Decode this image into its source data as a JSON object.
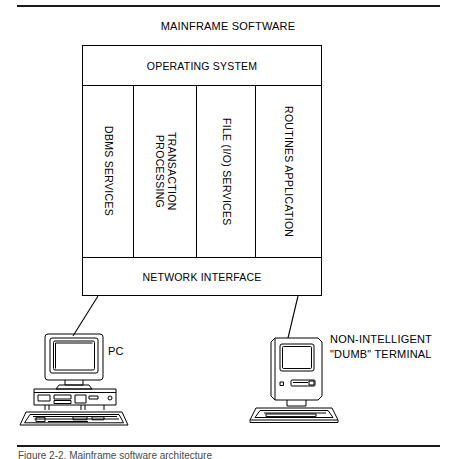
{
  "figure": {
    "title": "MAINFRAME SOFTWARE",
    "caption_partial": "Figure 2-2. Mainframe software architecture"
  },
  "mainframe": {
    "operating_system": "OPERATING SYSTEM",
    "network_interface": "NETWORK INTERFACE",
    "columns": [
      {
        "label": "DBMS SERVICES"
      },
      {
        "label": "TRANSACTION\nPROCESSING"
      },
      {
        "label": "FILE (I/O) SERVICES"
      },
      {
        "label": "ROUTINES APPLICATION"
      }
    ]
  },
  "devices": [
    {
      "id": "pc",
      "label": "PC"
    },
    {
      "id": "terminal",
      "label": "NON-INTELLIGENT\n\"DUMB\" TERMINAL"
    }
  ],
  "colors": {
    "line": "#000000",
    "rule": "#1a1a1a",
    "background": "#ffffff"
  }
}
